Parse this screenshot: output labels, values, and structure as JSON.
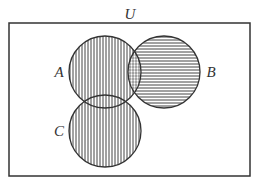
{
  "diagram": {
    "type": "venn",
    "universe_label": "U",
    "sets": [
      {
        "name": "A",
        "label": "A",
        "hatch": "vertical"
      },
      {
        "name": "B",
        "label": "B",
        "hatch": "horizontal"
      },
      {
        "name": "C",
        "label": "C",
        "hatch": "vertical"
      }
    ],
    "colors": {
      "stroke": "#333333",
      "hatch": "#444444",
      "background": "#ffffff"
    }
  }
}
